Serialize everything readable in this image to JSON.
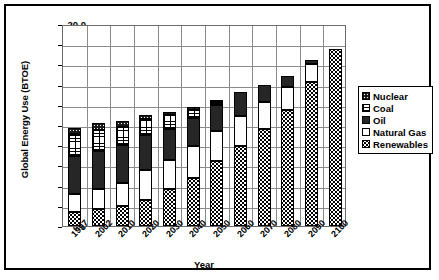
{
  "chart_data": {
    "type": "bar",
    "stacked": true,
    "title": "",
    "xlabel": "Year",
    "ylabel": "Global Energy Use (BTOE)",
    "ylim": [
      0.0,
      20.0
    ],
    "ytick_labels": [
      "20.0",
      "18.0",
      "16.0",
      "14.0",
      "12.0",
      "10.0",
      "8.0",
      "6.0",
      "4.0",
      "2.0",
      "0.0"
    ],
    "ytick_values": [
      20.0,
      18.0,
      16.0,
      14.0,
      12.0,
      10.0,
      8.0,
      6.0,
      4.0,
      2.0,
      0.0
    ],
    "grid": true,
    "legend_position": "right",
    "categories": [
      "1997",
      "2002",
      "2010",
      "2020",
      "2030",
      "2040",
      "2050",
      "2060",
      "2070",
      "2080",
      "2090",
      "2100"
    ],
    "series": [
      {
        "name": "Renewables",
        "pattern": "diagonal-crosshatch",
        "values": [
          1.4,
          1.65,
          2.0,
          2.6,
          3.65,
          4.8,
          6.45,
          7.95,
          9.6,
          11.5,
          14.3,
          17.55
        ]
      },
      {
        "name": "Natural Gas",
        "pattern": "solid-white",
        "values": [
          1.8,
          2.05,
          2.3,
          2.95,
          2.9,
          3.1,
          2.95,
          2.95,
          2.65,
          2.25,
          1.75,
          0.0
        ]
      },
      {
        "name": "Oil",
        "pattern": "solid-black",
        "values": [
          3.7,
          3.75,
          3.7,
          3.45,
          3.1,
          2.75,
          2.6,
          2.35,
          1.75,
          1.15,
          0.35,
          0.0
        ]
      },
      {
        "name": "Coal",
        "pattern": "brick",
        "values": [
          2.2,
          2.05,
          1.85,
          1.6,
          1.3,
          0.8,
          0.3,
          0.0,
          0.0,
          0.0,
          0.0,
          0.0
        ]
      },
      {
        "name": "Nuclear",
        "pattern": "dotted-black",
        "values": [
          0.6,
          0.7,
          0.55,
          0.4,
          0.35,
          0.35,
          0.2,
          0.0,
          0.0,
          0.0,
          0.0,
          0.0
        ]
      }
    ],
    "totals": [
      9.7,
      10.2,
      10.4,
      11.0,
      11.3,
      11.8,
      12.5,
      13.25,
      14.0,
      14.9,
      16.4,
      17.55
    ],
    "legend_order": [
      "Nuclear",
      "Coal",
      "Oil",
      "Natural Gas",
      "Renewables"
    ]
  }
}
